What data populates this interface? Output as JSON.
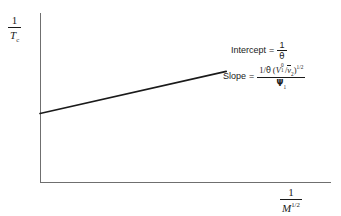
{
  "chart_data": {
    "type": "line",
    "title": "",
    "xlabel": "1/M^(1/2)",
    "ylabel": "1/T_c",
    "grid": false,
    "legend": null,
    "series": [
      {
        "name": "Inverse critical temperature vs inverse square-root molar mass",
        "x": [
          0.0,
          1.0
        ],
        "y": [
          0.405,
          0.795
        ],
        "annotation_intercept": "1/θ",
        "annotation_slope": "1/θ (V₁⁰/v̅2)^(1/2) / Ψ₁"
      }
    ],
    "xlim": [
      0,
      1
    ],
    "ylim": [
      0,
      1
    ]
  },
  "axes": {
    "y_label": {
      "numerator": "1",
      "denominator_base": "T",
      "denominator_sub": "c"
    },
    "x_label": {
      "numerator": "1",
      "denominator_base": "M",
      "denominator_sup": "1/2"
    }
  },
  "annotations": {
    "intercept": {
      "label": "Intercept",
      "equals": "=",
      "value_numerator": "1",
      "value_denominator": "θ"
    },
    "slope": {
      "label": "Slope",
      "equals": "=",
      "numerator_prefix": "1/",
      "numerator_theta": "θ",
      "numerator_open": "(",
      "numerator_V": "V",
      "numerator_V_sup": "0",
      "numerator_V_sub": "1",
      "numerator_slash": "/",
      "numerator_v": "v",
      "numerator_v_sub": "2",
      "numerator_close": ")",
      "numerator_exp": "1/2",
      "denominator_psi": "Ψ",
      "denominator_psi_sub": "1"
    }
  },
  "colors": {
    "background": "#ffffff",
    "axis": "#6f6f6f",
    "line": "#1a1a1a",
    "text": "#1a1a1a"
  }
}
